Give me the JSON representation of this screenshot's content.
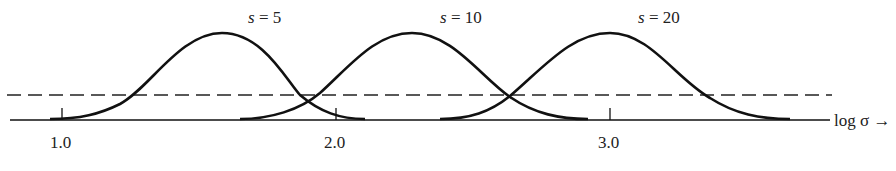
{
  "figure": {
    "axis_label": "log σ →",
    "ticks": [
      {
        "label": "1.0",
        "x": 62
      },
      {
        "label": "2.0",
        "x": 336
      },
      {
        "label": "3.0",
        "x": 610
      }
    ],
    "curves": [
      {
        "label_var": "s",
        "label_text": "s = 5",
        "peak_x": 222,
        "start_x": 50,
        "end_x": 255
      },
      {
        "label_var": "s",
        "label_text": "s = 10",
        "peak_x": 412,
        "start_x": 240,
        "end_x": 588
      },
      {
        "label_var": "s",
        "label_text": "s = 20",
        "peak_x": 610,
        "start_x": 440,
        "end_x": 790
      }
    ],
    "threshold": "dashed horizontal line"
  }
}
